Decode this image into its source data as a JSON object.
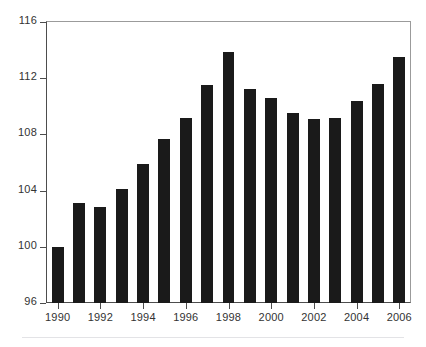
{
  "chart_data": {
    "type": "bar",
    "title": "",
    "subtitle": "",
    "xlabel": "",
    "ylabel": "",
    "categories": [
      "1990",
      "1991",
      "1992",
      "1993",
      "1994",
      "1995",
      "1996",
      "1997",
      "1998",
      "1999",
      "2000",
      "2001",
      "2002",
      "2003",
      "2004",
      "2005",
      "2006"
    ],
    "values": [
      100.0,
      103.1,
      102.8,
      104.1,
      105.9,
      107.7,
      109.2,
      111.5,
      113.9,
      111.2,
      110.6,
      109.5,
      109.1,
      109.2,
      110.4,
      111.6,
      113.5
    ],
    "ylim": [
      96,
      116
    ],
    "yticks": [
      96,
      100,
      104,
      108,
      112,
      116
    ],
    "ytick_labels": [
      "96",
      "100",
      "104",
      "108",
      "112",
      "116"
    ],
    "xtick_labels": [
      "1990",
      "1992",
      "1994",
      "1996",
      "1998",
      "2000",
      "2002",
      "2004",
      "2006"
    ],
    "xtick_categories": [
      "1990",
      "1992",
      "1994",
      "1996",
      "1998",
      "2000",
      "2002",
      "2004",
      "2006"
    ],
    "grid": false,
    "legend": null,
    "legend_position": "none",
    "annotations": [],
    "colors": {
      "bar": "#1a1a1a",
      "axis": "#4d4d4d",
      "frame": "#9b9b9b",
      "tick_label": "#333333",
      "background": "#ffffff",
      "footer_rule": "#e3e3e6"
    }
  }
}
